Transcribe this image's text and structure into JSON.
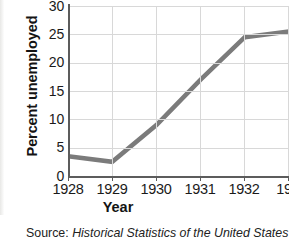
{
  "chart_data": {
    "type": "line",
    "title": "",
    "xlabel": "Year",
    "ylabel": "Percent unemployed",
    "x": [
      1928,
      1929,
      1930,
      1931,
      1932,
      1933
    ],
    "categories": [
      "1928",
      "1929",
      "1930",
      "1931",
      "1932",
      "1933"
    ],
    "values": [
      3.5,
      2.5,
      9.0,
      17.0,
      24.5,
      25.5
    ],
    "series": [
      {
        "name": "Percent unemployed",
        "values": [
          3.5,
          2.5,
          9.0,
          17.0,
          24.5,
          25.5
        ]
      }
    ],
    "xlim": [
      1928,
      1933
    ],
    "ylim": [
      0,
      30
    ],
    "ytick_labels": [
      "0",
      "5",
      "10",
      "15",
      "20",
      "25",
      "30"
    ],
    "ytick_values": [
      0,
      5,
      10,
      15,
      20,
      25,
      30
    ],
    "xtick_labels": [
      "1928",
      "1929",
      "1930",
      "1931",
      "1932",
      "193"
    ],
    "grid": true,
    "legend": "none",
    "line_color": "#7b7b7b",
    "grid_color": "#d8d8d8",
    "axis_color": "#5c5c5c"
  },
  "caption": {
    "source_prefix": "Source:",
    "source_title": "Historical Statistics of the United States"
  }
}
